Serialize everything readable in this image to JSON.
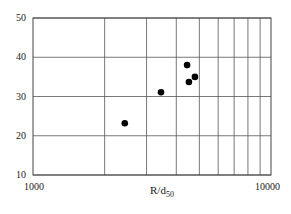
{
  "chart_data": {
    "type": "scatter",
    "title": "",
    "xlabel": "R/d",
    "xlabel_subscript": "50",
    "ylabel": "",
    "xscale": "log",
    "xlim": [
      1000,
      10000
    ],
    "ylim": [
      10,
      50
    ],
    "x_tick_labels": [
      "1000",
      "10000"
    ],
    "x_minor_gridlines": [
      2000,
      3000,
      4000,
      5000,
      6000,
      7000,
      8000,
      9000
    ],
    "y_ticks": [
      10,
      20,
      30,
      40,
      50
    ],
    "y_tick_labels": [
      "10",
      "20",
      "30",
      "40",
      "50"
    ],
    "grid": true,
    "legend": null,
    "series": [
      {
        "name": "data",
        "marker": "filled-circle",
        "color": "#000000",
        "points": [
          {
            "x": 2430,
            "y": 23.2
          },
          {
            "x": 3450,
            "y": 31.1
          },
          {
            "x": 4440,
            "y": 38.0
          },
          {
            "x": 4520,
            "y": 33.7
          },
          {
            "x": 4790,
            "y": 35.0
          }
        ]
      }
    ]
  },
  "colors": {
    "frame": "#444444",
    "grid": "#555555",
    "marker": "#000000"
  }
}
